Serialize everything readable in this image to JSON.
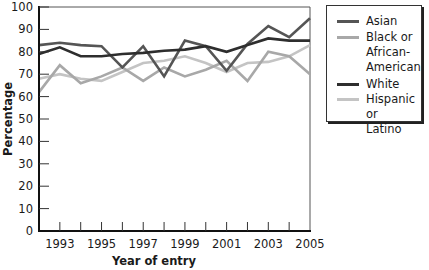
{
  "chart_data": {
    "type": "line",
    "title": "",
    "xlabel": "Year of entry",
    "ylabel": "Percentage",
    "x": [
      1992,
      1993,
      1994,
      1995,
      1996,
      1997,
      1998,
      1999,
      2000,
      2001,
      2002,
      2003,
      2004,
      2005
    ],
    "x_tick_labels": [
      "1993",
      "1995",
      "1997",
      "1999",
      "2001",
      "2003",
      "2005"
    ],
    "y_tick_labels": [
      "0",
      "10",
      "20",
      "30",
      "40",
      "50",
      "60",
      "70",
      "80",
      "90",
      "100"
    ],
    "ylim": [
      0,
      100
    ],
    "xlim": [
      1992,
      2005
    ],
    "grid": false,
    "legend_position": "right",
    "series": [
      {
        "name": "Asian",
        "color": "#555555",
        "values": [
          83,
          84,
          83,
          82.5,
          73,
          82.5,
          69,
          85,
          82.5,
          71.5,
          83.5,
          91.5,
          86.5,
          95
        ]
      },
      {
        "name": "Black or African-American",
        "color": "#a8a8a8",
        "values": [
          62,
          74,
          66,
          69,
          73,
          67,
          73,
          69,
          72,
          76,
          67,
          80,
          78,
          70
        ]
      },
      {
        "name": "White",
        "color": "#2e2e2e",
        "values": [
          79,
          82,
          78,
          78,
          79,
          79.5,
          80.5,
          81,
          82.5,
          80,
          83,
          86,
          85,
          85
        ]
      },
      {
        "name": "Hispanic or Latino",
        "color": "#c4c4c4",
        "values": [
          68,
          70,
          68,
          67,
          71,
          75,
          76,
          78,
          75,
          71,
          75,
          75.5,
          78,
          83
        ]
      }
    ]
  },
  "legend": {
    "items": [
      {
        "label": "Asian",
        "color": "#555555"
      },
      {
        "label": "Black or\nAfrican-\nAmerican",
        "color": "#a8a8a8"
      },
      {
        "label": "White",
        "color": "#2e2e2e"
      },
      {
        "label": "Hispanic or\nLatino",
        "color": "#c4c4c4"
      }
    ]
  },
  "axes": {
    "x_title": "Year of entry",
    "y_title": "Percentage"
  }
}
